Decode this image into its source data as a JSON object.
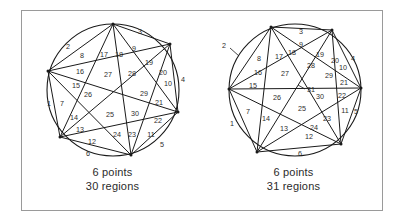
{
  "figure": {
    "frame": {
      "border_color": "#9a9a9a"
    },
    "stroke_color": "#1a1a1a",
    "label_color": "#2d2d2d"
  },
  "panels": [
    {
      "id": "left",
      "points_caption": "6 points",
      "regions_caption": "30 regions",
      "point_count": 6,
      "region_count": 30,
      "note": "generic position - no three chords concurrent is violated at center, giving 30 regions",
      "circle": {
        "cx": 91,
        "cy": 79,
        "r": 66
      },
      "vertices": [
        {
          "name": "v-top",
          "x": 91,
          "y": 13
        },
        {
          "name": "v-upper-right",
          "x": 148,
          "y": 33
        },
        {
          "name": "v-right",
          "x": 156,
          "y": 101
        },
        {
          "name": "v-bottom",
          "x": 109,
          "y": 144
        },
        {
          "name": "v-lower-left",
          "x": 38,
          "y": 126
        },
        {
          "name": "v-left",
          "x": 26,
          "y": 60
        }
      ],
      "region_labels": [
        {
          "n": "1",
          "x": 27,
          "y": 93
        },
        {
          "n": "2",
          "x": 46,
          "y": 36
        },
        {
          "n": "3",
          "x": 118,
          "y": 21
        },
        {
          "n": "4",
          "x": 161,
          "y": 69
        },
        {
          "n": "5",
          "x": 140,
          "y": 134
        },
        {
          "n": "6",
          "x": 66,
          "y": 143
        },
        {
          "n": "7",
          "x": 40,
          "y": 93
        },
        {
          "n": "8",
          "x": 60,
          "y": 45
        },
        {
          "n": "9",
          "x": 112,
          "y": 38
        },
        {
          "n": "10",
          "x": 146,
          "y": 73
        },
        {
          "n": "11",
          "x": 129,
          "y": 124
        },
        {
          "n": "12",
          "x": 70,
          "y": 131
        },
        {
          "n": "13",
          "x": 58,
          "y": 119
        },
        {
          "n": "14",
          "x": 52,
          "y": 107
        },
        {
          "n": "15",
          "x": 54,
          "y": 75
        },
        {
          "n": "16",
          "x": 58,
          "y": 61
        },
        {
          "n": "17",
          "x": 82,
          "y": 44
        },
        {
          "n": "18",
          "x": 97,
          "y": 44
        },
        {
          "n": "19",
          "x": 127,
          "y": 52
        },
        {
          "n": "20",
          "x": 141,
          "y": 62
        },
        {
          "n": "21",
          "x": 137,
          "y": 92
        },
        {
          "n": "22",
          "x": 136,
          "y": 110
        },
        {
          "n": "23",
          "x": 110,
          "y": 124
        },
        {
          "n": "24",
          "x": 95,
          "y": 124
        },
        {
          "n": "25",
          "x": 88,
          "y": 104
        },
        {
          "n": "26",
          "x": 66,
          "y": 84
        },
        {
          "n": "27",
          "x": 86,
          "y": 64
        },
        {
          "n": "28",
          "x": 110,
          "y": 63
        },
        {
          "n": "29",
          "x": 122,
          "y": 83
        },
        {
          "n": "30",
          "x": 113,
          "y": 103
        }
      ],
      "leader_lines": []
    },
    {
      "id": "right",
      "points_caption": "6 points",
      "regions_caption": "31 regions",
      "point_count": 6,
      "region_count": 31,
      "note": "points moved so no three diagonals meet at one point, giving the maximum 31 regions",
      "circle": {
        "cx": 92,
        "cy": 79,
        "r": 66
      },
      "vertices": [
        {
          "name": "v-top-left",
          "x": 68,
          "y": 16
        },
        {
          "name": "v-top-right",
          "x": 129,
          "y": 19
        },
        {
          "name": "v-right",
          "x": 158,
          "y": 77
        },
        {
          "name": "v-lower-right",
          "x": 138,
          "y": 133
        },
        {
          "name": "v-lower-left",
          "x": 54,
          "y": 141
        },
        {
          "name": "v-left",
          "x": 26,
          "y": 78
        }
      ],
      "region_labels": [
        {
          "n": "1",
          "x": 29,
          "y": 113
        },
        {
          "n": "2",
          "x": 21,
          "y": 35
        },
        {
          "n": "3",
          "x": 98,
          "y": 21
        },
        {
          "n": "4",
          "x": 150,
          "y": 48
        },
        {
          "n": "5",
          "x": 153,
          "y": 101
        },
        {
          "n": "6",
          "x": 97,
          "y": 143
        },
        {
          "n": "7",
          "x": 45,
          "y": 101
        },
        {
          "n": "8",
          "x": 56,
          "y": 48
        },
        {
          "n": "9",
          "x": 98,
          "y": 34
        },
        {
          "n": "10",
          "x": 140,
          "y": 57
        },
        {
          "n": "11",
          "x": 142,
          "y": 100
        },
        {
          "n": "12",
          "x": 106,
          "y": 126
        },
        {
          "n": "13",
          "x": 81,
          "y": 118
        },
        {
          "n": "14",
          "x": 63,
          "y": 108
        },
        {
          "n": "15",
          "x": 50,
          "y": 75
        },
        {
          "n": "16",
          "x": 55,
          "y": 62
        },
        {
          "n": "17",
          "x": 76,
          "y": 46
        },
        {
          "n": "18",
          "x": 89,
          "y": 42
        },
        {
          "n": "19",
          "x": 117,
          "y": 44
        },
        {
          "n": "20",
          "x": 132,
          "y": 50
        },
        {
          "n": "21",
          "x": 141,
          "y": 72
        },
        {
          "n": "22",
          "x": 139,
          "y": 85
        },
        {
          "n": "23",
          "x": 124,
          "y": 108
        },
        {
          "n": "24",
          "x": 111,
          "y": 117
        },
        {
          "n": "25",
          "x": 99,
          "y": 98
        },
        {
          "n": "26",
          "x": 74,
          "y": 87
        },
        {
          "n": "27",
          "x": 82,
          "y": 63
        },
        {
          "n": "28",
          "x": 108,
          "y": 55
        },
        {
          "n": "29",
          "x": 126,
          "y": 65
        },
        {
          "n": "30",
          "x": 117,
          "y": 86
        },
        {
          "n": "31",
          "x": 108,
          "y": 79
        }
      ],
      "leader_lines": [
        {
          "name": "leader-2",
          "x1": 27,
          "y1": 37,
          "x2": 36,
          "y2": 45
        },
        {
          "name": "leader-31",
          "x1": 102,
          "y1": 78,
          "x2": 95,
          "y2": 74
        }
      ]
    }
  ]
}
